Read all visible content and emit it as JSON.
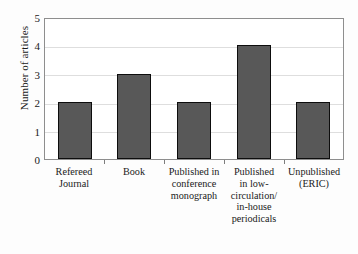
{
  "chart_data": {
    "type": "bar",
    "title": "",
    "subtitle": "",
    "xlabel": "",
    "ylabel": "Number of articles",
    "categories": [
      "Refereed Journal",
      "Book",
      "Published in conference monograph",
      "Published in low-circulation/ in-house periodicals",
      "Unpublished (ERIC)"
    ],
    "values": [
      2,
      3,
      2,
      4,
      2
    ],
    "ylim": [
      0,
      5
    ],
    "ytick_labels": [
      "0",
      "1",
      "2",
      "3",
      "4",
      "5"
    ],
    "ytick_values": [
      0,
      1,
      2,
      3,
      4,
      5
    ],
    "grid": true,
    "grid_axis": "y",
    "legend": false,
    "legend_position": "none",
    "bar_fill_color": "#585858",
    "bar_edge_color": "#0d0d0d",
    "gridline_color": "#dedede",
    "frame_color": "#8e8e8e",
    "background_color": "#ffffff"
  },
  "axis": {
    "y_title": "Number of articles",
    "ticks": [
      {
        "label": "5",
        "value": 5
      },
      {
        "label": "4",
        "value": 4
      },
      {
        "label": "3",
        "value": 3
      },
      {
        "label": "2",
        "value": 2
      },
      {
        "label": "1",
        "value": 1
      },
      {
        "label": "0",
        "value": 0
      }
    ]
  },
  "bars": [
    {
      "label": "Refereed Journal",
      "label_lines": [
        "Refereed",
        "Journal"
      ],
      "value": 2
    },
    {
      "label": "Book",
      "label_lines": [
        "Book"
      ],
      "value": 3
    },
    {
      "label": "Published in conference monograph",
      "label_lines": [
        "Published in",
        "conference",
        "monograph"
      ],
      "value": 2
    },
    {
      "label": "Published in low-circulation/ in-house periodicals",
      "label_lines": [
        "Published",
        "in low-",
        "circulation/",
        "in-house",
        "periodicals"
      ],
      "value": 4
    },
    {
      "label": "Unpublished (ERIC)",
      "label_lines": [
        "Unpublished",
        "(ERIC)"
      ],
      "value": 2
    }
  ]
}
